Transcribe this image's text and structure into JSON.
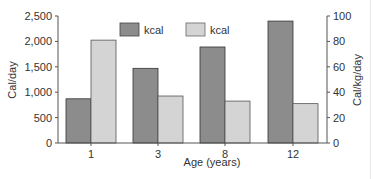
{
  "chart_data": {
    "type": "bar",
    "title": "",
    "categories": [
      "1",
      "3",
      "8",
      "12"
    ],
    "series": [
      {
        "name": "kcal",
        "axis": "left",
        "unit": "Cal/day",
        "color": "#8c8c8c",
        "values": [
          870,
          1470,
          1890,
          2400
        ]
      },
      {
        "name": "kcal",
        "axis": "right",
        "unit": "Cal/kg/day",
        "color": "#d4d4d4",
        "values": [
          81,
          37,
          33,
          31
        ]
      }
    ],
    "xlabel": "Age (years)",
    "ylabel": "Cal/day",
    "y2label": "Cal/kg/day",
    "ylim": [
      0,
      2500
    ],
    "y2lim": [
      0,
      100
    ],
    "yticks": [
      "0",
      "500",
      "1,000",
      "1,500",
      "2,000",
      "2,500"
    ],
    "y2ticks": [
      "0",
      "20",
      "40",
      "60",
      "80",
      "100"
    ],
    "grid": false,
    "legend_position": "top-center"
  },
  "legend": {
    "dark_label": "kcal",
    "light_label": "kcal"
  }
}
